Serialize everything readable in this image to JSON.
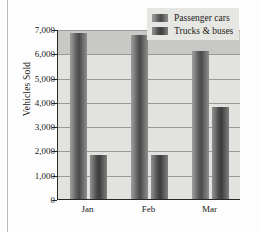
{
  "chart_data": {
    "type": "bar",
    "title": "",
    "xlabel": "",
    "ylabel": "Vehicles Sold",
    "categories": [
      "Jan",
      "Feb",
      "Mar"
    ],
    "series": [
      {
        "name": "Passenger cars",
        "values": [
          6850,
          6750,
          6100
        ],
        "color": "#5d5d5d"
      },
      {
        "name": "Trucks & buses",
        "values": [
          1800,
          1800,
          3800
        ],
        "color": "#3c3c3c"
      }
    ],
    "ylim": [
      0,
      7000
    ],
    "yticks": [
      0,
      1000,
      2000,
      3000,
      4000,
      5000,
      6000,
      7000
    ],
    "ytick_labels": [
      "0",
      "1,000",
      "2,000",
      "3,000",
      "4,000",
      "5,000",
      "6,000",
      "7,000"
    ],
    "grid": true,
    "legend_position": "top-right",
    "plot_background": "#e2e2de",
    "legend_background": "#e6e6e2"
  },
  "legend": {
    "entries": [
      {
        "label": "Passenger cars"
      },
      {
        "label": "Trucks & buses"
      }
    ]
  },
  "axes": {
    "y_title": "Vehicles Sold"
  }
}
